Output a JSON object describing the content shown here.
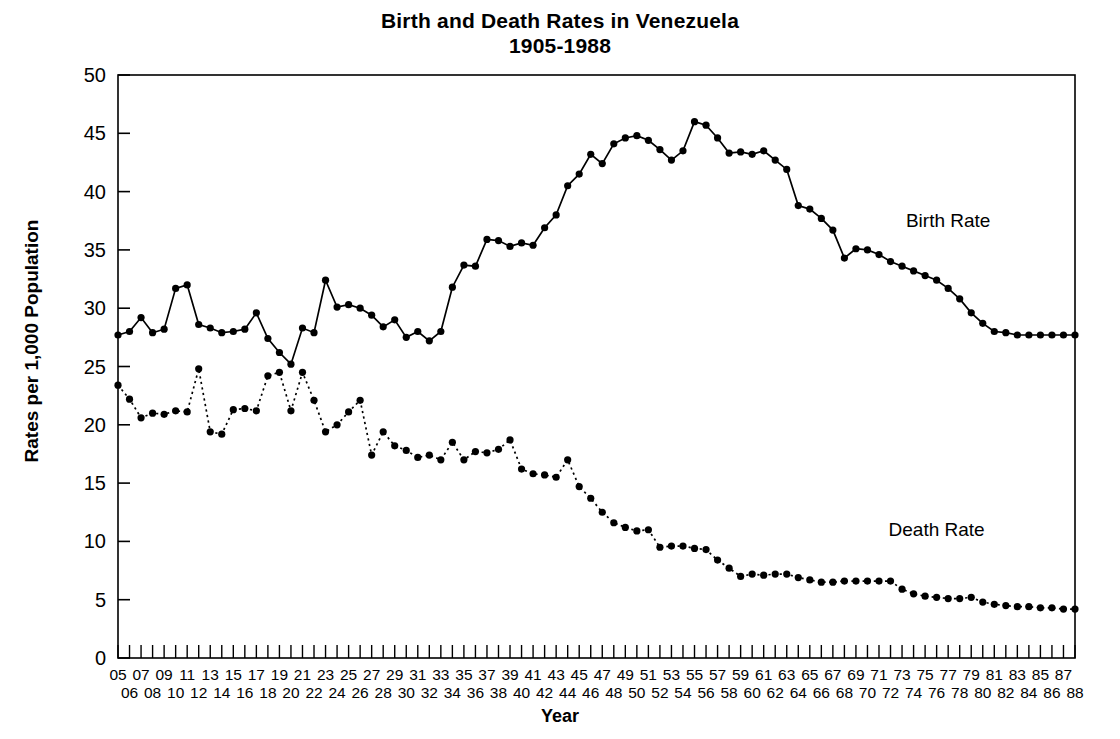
{
  "chart_data": {
    "type": "line",
    "title": "Birth and Death Rates in Venezuela",
    "subtitle": "1905-1988",
    "xlabel": "Year",
    "ylabel": "Rates per 1,000 Population",
    "ylim": [
      0,
      50
    ],
    "ytick_step": 5,
    "yticks": [
      "0",
      "5",
      "10",
      "15",
      "20",
      "25",
      "30",
      "35",
      "40",
      "45",
      "50"
    ],
    "grid": false,
    "legend_position": "inline-annotation",
    "x_axis_style": "staggered two-row two-digit year labels; odd years on upper row, even years on lower row",
    "xlim": [
      1905,
      1988
    ],
    "x": [
      1905,
      1906,
      1907,
      1908,
      1909,
      1910,
      1911,
      1912,
      1913,
      1914,
      1915,
      1916,
      1917,
      1918,
      1919,
      1920,
      1921,
      1922,
      1923,
      1924,
      1925,
      1926,
      1927,
      1928,
      1929,
      1930,
      1931,
      1932,
      1933,
      1934,
      1935,
      1936,
      1937,
      1938,
      1939,
      1940,
      1941,
      1942,
      1943,
      1944,
      1945,
      1946,
      1947,
      1948,
      1949,
      1950,
      1951,
      1952,
      1953,
      1954,
      1955,
      1956,
      1957,
      1958,
      1959,
      1960,
      1961,
      1962,
      1963,
      1964,
      1965,
      1966,
      1967,
      1968,
      1969,
      1970,
      1971,
      1972,
      1973,
      1974,
      1975,
      1976,
      1977,
      1978,
      1979,
      1980,
      1981,
      1982,
      1983,
      1984,
      1985,
      1986,
      1987,
      1988
    ],
    "xtick_labels_top": [
      "05",
      "07",
      "09",
      "11",
      "13",
      "15",
      "17",
      "19",
      "21",
      "23",
      "25",
      "27",
      "29",
      "31",
      "33",
      "35",
      "37",
      "39",
      "41",
      "43",
      "45",
      "47",
      "49",
      "51",
      "53",
      "55",
      "57",
      "59",
      "61",
      "63",
      "65",
      "67",
      "69",
      "71",
      "73",
      "75",
      "77",
      "79",
      "81",
      "83",
      "85",
      "87"
    ],
    "xtick_labels_bottom": [
      "06",
      "08",
      "10",
      "12",
      "14",
      "16",
      "18",
      "20",
      "22",
      "24",
      "26",
      "28",
      "30",
      "32",
      "34",
      "36",
      "38",
      "40",
      "42",
      "44",
      "46",
      "48",
      "50",
      "52",
      "54",
      "56",
      "58",
      "60",
      "62",
      "64",
      "66",
      "68",
      "70",
      "72",
      "74",
      "76",
      "78",
      "80",
      "82",
      "84",
      "86",
      "88"
    ],
    "series": [
      {
        "name": "Birth Rate",
        "line_style": "solid",
        "marker": "filled-circle",
        "color": "#000000",
        "label_x": 1977,
        "label_y": 37.0,
        "values": [
          27.7,
          28.0,
          29.2,
          27.9,
          28.2,
          31.7,
          32.0,
          28.6,
          28.3,
          27.9,
          28.0,
          28.2,
          29.6,
          27.4,
          26.2,
          25.2,
          28.3,
          27.9,
          32.4,
          30.1,
          30.3,
          30.0,
          29.4,
          28.4,
          29.0,
          27.5,
          28.0,
          27.2,
          28.0,
          31.8,
          33.7,
          33.6,
          35.9,
          35.8,
          35.3,
          35.6,
          35.4,
          36.9,
          38.0,
          40.5,
          41.5,
          43.2,
          42.4,
          44.1,
          44.6,
          44.8,
          44.4,
          43.6,
          42.7,
          43.5,
          46.0,
          45.7,
          44.6,
          43.3,
          43.4,
          43.2,
          43.5,
          42.7,
          41.9,
          38.8,
          38.5,
          37.7,
          36.7,
          34.3,
          35.1,
          35.0,
          34.6,
          34.0,
          33.6,
          33.2,
          32.8,
          32.4,
          31.7,
          30.8,
          29.6,
          28.7,
          28.0,
          27.9,
          27.7,
          27.7,
          27.7,
          27.7,
          27.7,
          27.7
        ]
      },
      {
        "name": "Death Rate",
        "line_style": "dotted",
        "marker": "filled-circle",
        "color": "#000000",
        "label_x": 1976,
        "label_y": 10.5,
        "values": [
          23.4,
          22.2,
          20.6,
          21.0,
          20.9,
          21.2,
          21.1,
          24.8,
          19.4,
          19.2,
          21.3,
          21.4,
          21.2,
          24.2,
          24.5,
          21.2,
          24.5,
          22.1,
          19.4,
          20.0,
          21.1,
          22.1,
          17.4,
          19.4,
          18.2,
          17.8,
          17.2,
          17.4,
          17.0,
          18.5,
          17.0,
          17.7,
          17.6,
          17.9,
          18.7,
          16.2,
          15.8,
          15.7,
          15.5,
          17.0,
          14.7,
          13.7,
          12.5,
          11.6,
          11.2,
          10.9,
          11.0,
          9.5,
          9.6,
          9.6,
          9.4,
          9.3,
          8.4,
          7.7,
          7.0,
          7.2,
          7.1,
          7.2,
          7.2,
          6.9,
          6.7,
          6.5,
          6.5,
          6.6,
          6.6,
          6.6,
          6.6,
          6.6,
          5.9,
          5.5,
          5.3,
          5.2,
          5.1,
          5.1,
          5.2,
          4.8,
          4.6,
          4.5,
          4.4,
          4.4,
          4.3,
          4.3,
          4.2,
          4.2
        ]
      }
    ]
  }
}
